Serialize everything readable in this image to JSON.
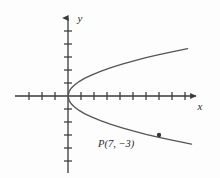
{
  "figure": {
    "background_color": "#fdfdfd",
    "ink_color": "#4a4a4a",
    "axis_color": "#3a3a3a",
    "curve_color": "#555555",
    "width": 220,
    "height": 178
  },
  "axes": {
    "x_label": "x",
    "y_label": "y",
    "origin_px": {
      "x": 68,
      "y": 96
    },
    "tick_spacing_px": 13,
    "x_ticks_left": 4,
    "x_ticks_right": 9,
    "y_ticks_up": 5,
    "y_ticks_down": 5,
    "tick_half_length_px": 4,
    "has_arrowheads": true,
    "grid": false
  },
  "annotations": {
    "point_label": "P(7, −3)",
    "point_label_px": {
      "x": 98,
      "y": 143
    },
    "point_marker_px": {
      "x": 153,
      "y": 130
    },
    "point_marker_radius_px": 2.2
  },
  "chart_data": {
    "type": "line",
    "title": "",
    "subtitle": "",
    "xlabel": "x",
    "ylabel": "y",
    "grid": false,
    "legend": "none",
    "xlim": [
      -4.1,
      9.5
    ],
    "ylim": [
      -6.3,
      6.3
    ],
    "annotations": [
      {
        "text": "P(7, −3)",
        "x": 7,
        "y": -3,
        "marker": true
      }
    ],
    "series": [
      {
        "name": "parabola y^2 = (9/7) x, upper branch",
        "type": "line",
        "x": [
          0.0,
          0.1,
          0.25,
          0.5,
          0.85,
          1.3,
          1.85,
          2.5,
          3.25,
          4.1,
          5.0,
          6.0,
          7.0,
          8.0,
          9.2
        ],
        "y": [
          0.0,
          0.38,
          0.6,
          0.85,
          1.11,
          1.37,
          1.63,
          1.9,
          2.17,
          2.43,
          2.69,
          2.95,
          3.18,
          3.4,
          3.64
        ]
      },
      {
        "name": "parabola y^2 = (9/7) x, lower branch",
        "type": "line",
        "x": [
          0.0,
          0.1,
          0.25,
          0.5,
          0.85,
          1.3,
          1.85,
          2.5,
          3.25,
          4.1,
          5.0,
          6.0,
          7.0,
          8.0,
          9.5
        ],
        "y": [
          0.0,
          -0.38,
          -0.6,
          -0.85,
          -1.11,
          -1.37,
          -1.63,
          -1.9,
          -2.17,
          -2.43,
          -2.69,
          -2.95,
          -3.18,
          -3.4,
          -3.7
        ]
      }
    ]
  }
}
